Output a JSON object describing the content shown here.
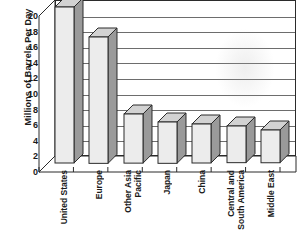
{
  "chart_data": {
    "type": "bar",
    "title": "",
    "subtitle": "",
    "xlabel": "",
    "ylabel": "Millions of Barrels Per Day",
    "ylim": [
      0,
      20
    ],
    "ytick_step": 2,
    "ytick_labels": [
      "20",
      "18",
      "16",
      "14",
      "12",
      "10",
      "8",
      "6",
      "4",
      "2",
      "0"
    ],
    "grid": true,
    "legend": false,
    "style": "3d-bar",
    "categories": [
      "United States",
      "Europe",
      "Other Asia Pacific",
      "Japan",
      "China",
      "Central and South America",
      "Middle East"
    ],
    "category_lines": [
      [
        "United States"
      ],
      [
        "Europe"
      ],
      [
        "Other Asia",
        "Pacific"
      ],
      [
        "Japan"
      ],
      [
        "China"
      ],
      [
        "Central and",
        "South America"
      ],
      [
        "Middle East"
      ]
    ],
    "values": [
      20.0,
      16.2,
      6.3,
      5.3,
      5.0,
      4.7,
      4.2
    ],
    "colors": {
      "bar_front": "#ececec",
      "bar_side": "#9a9a9a",
      "bar_top": "#d2d2d2",
      "outline": "#2b2b2b",
      "gridline": "#6d6d6d",
      "background": "#ffffff",
      "text": "#1a1a1a"
    }
  }
}
